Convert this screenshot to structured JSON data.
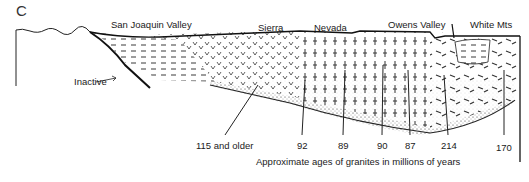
{
  "figure": {
    "panel_label": "C",
    "regions": [
      {
        "name": "San Joaquin Valley",
        "x": 111,
        "y": 25
      },
      {
        "name": "Sierra",
        "x": 258,
        "y": 28
      },
      {
        "name": "Nevada",
        "x": 314,
        "y": 28
      },
      {
        "name": "Owens Valley",
        "x": 388,
        "y": 24
      },
      {
        "name": "White Mts",
        "x": 470,
        "y": 24
      }
    ],
    "fault_annotation": "Inactive",
    "granite_ages": [
      {
        "label": "115 and older",
        "x": 196
      },
      {
        "label": "92",
        "x": 300
      },
      {
        "label": "89",
        "x": 341
      },
      {
        "label": "90",
        "x": 381
      },
      {
        "label": "87",
        "x": 408
      },
      {
        "label": "214",
        "x": 446
      },
      {
        "label": "170",
        "x": 503
      }
    ],
    "caption": "Approximate ages of granites in millions of years"
  },
  "colors": {
    "ink": "#1a1a1a",
    "background": "#ffffff"
  }
}
